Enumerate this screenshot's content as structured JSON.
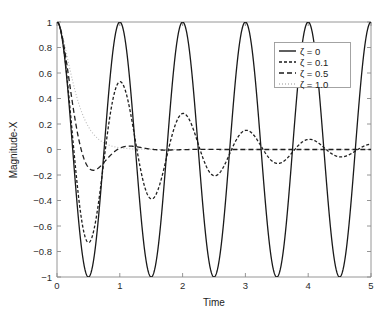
{
  "chart_data": {
    "type": "line",
    "title": "",
    "xlabel": "Time",
    "ylabel": "Magnitude-X",
    "xlim": [
      0,
      5
    ],
    "ylim": [
      -1,
      1
    ],
    "xticks": [
      "0",
      "1",
      "2",
      "3",
      "4",
      "5"
    ],
    "xtick_values": [
      0,
      1,
      2,
      3,
      4,
      5
    ],
    "yticks": [
      "1",
      "0.8",
      "0.6",
      "0.4",
      "0.2",
      "0",
      "−0.2",
      "−0.4",
      "−0.6",
      "−0.8",
      "−1"
    ],
    "ytick_values": [
      1,
      0.8,
      0.6,
      0.4,
      0.2,
      0,
      -0.2,
      -0.4,
      -0.6,
      -0.8,
      -1
    ],
    "grid": false,
    "legend_position": "upper right",
    "series": [
      {
        "name": "ζ = 0",
        "zeta": 0,
        "style": "solid",
        "color": "#1a1a1a",
        "description": "Undamped free vibration, cos(2πt), constant unit amplitude",
        "peaks_t": [
          0,
          1,
          2,
          3,
          4,
          5
        ],
        "peaks_y": [
          1,
          1,
          1,
          1,
          1,
          1
        ],
        "troughs_t": [
          0.5,
          1.5,
          2.5,
          3.5,
          4.5
        ],
        "troughs_y": [
          -1,
          -1,
          -1,
          -1,
          -1
        ]
      },
      {
        "name": "ζ = 0.1",
        "zeta": 0.1,
        "style": "dashed-fine",
        "color": "#1a1a1a",
        "description": "Lightly damped, slowly decaying oscillation",
        "peaks_t": [
          1.0,
          2.0,
          3.0,
          4.0
        ],
        "peaks_y": [
          0.54,
          0.29,
          0.16,
          0.07
        ],
        "troughs_t": [
          0.5,
          1.5,
          2.5,
          3.5,
          4.5
        ],
        "troughs_y": [
          -0.73,
          -0.39,
          -0.21,
          -0.11,
          -0.06
        ]
      },
      {
        "name": "ζ = 0.5",
        "zeta": 0.5,
        "style": "dashed-long",
        "color": "#1a1a1a",
        "description": "Heavily damped, single undershoot then settles to zero",
        "peaks_t": [
          1.2
        ],
        "peaks_y": [
          0.03
        ],
        "troughs_t": [
          0.55
        ],
        "troughs_y": [
          -0.16
        ]
      },
      {
        "name": "ζ = 1.0",
        "zeta": 1.0,
        "style": "dotted",
        "color": "#b4b4b4",
        "description": "Critically damped, monotonic decay to zero with no overshoot",
        "peaks_t": [],
        "peaks_y": [],
        "troughs_t": [],
        "troughs_y": []
      }
    ],
    "sample_points": {
      "t": [
        0,
        0.1,
        0.2,
        0.3,
        0.4,
        0.5,
        0.6,
        0.7,
        0.8,
        0.9,
        1.0,
        1.25,
        1.5,
        1.75,
        2.0,
        2.25,
        2.5,
        2.75,
        3.0,
        3.25,
        3.5,
        3.75,
        4.0,
        4.25,
        4.5,
        4.75,
        5.0
      ],
      "zeta_0": [
        1,
        0.81,
        0.31,
        -0.31,
        -0.81,
        -1,
        -0.81,
        -0.31,
        0.31,
        0.81,
        1,
        0,
        -1,
        0,
        1,
        0,
        -1,
        0,
        1,
        0,
        -1,
        0,
        1,
        0,
        -1,
        0,
        1
      ],
      "zeta_0_1": [
        1,
        0.76,
        0.27,
        -0.26,
        -0.73,
        -0.88,
        -0.69,
        -0.26,
        0.24,
        0.5,
        0.54,
        0.0,
        -0.39,
        0.0,
        0.29,
        0.0,
        -0.21,
        0.0,
        0.16,
        0.0,
        -0.11,
        0.0,
        0.07,
        0.0,
        -0.06,
        0.0,
        0.06
      ],
      "zeta_0_5": [
        1,
        0.62,
        0.27,
        0.02,
        -0.11,
        -0.16,
        -0.15,
        -0.12,
        -0.07,
        -0.03,
        0.0,
        0.03,
        0.03,
        0.02,
        0.02,
        0.01,
        0.01,
        0.01,
        0.01,
        0.0,
        0.0,
        0.0,
        0.0,
        0.0,
        0.0,
        0.0,
        0.0
      ],
      "zeta_1_0": [
        1,
        0.83,
        0.63,
        0.46,
        0.33,
        0.23,
        0.16,
        0.11,
        0.07,
        0.05,
        0.03,
        0.01,
        0.01,
        0.0,
        0.0,
        0.0,
        0.0,
        0.0,
        0.0,
        0.0,
        0.0,
        0.0,
        0.0,
        0.0,
        0.0,
        0.0,
        0.0
      ]
    }
  },
  "axes": {
    "ylabel": "Magnitude-X",
    "xlabel": "Time"
  },
  "legend": {
    "entries": [
      {
        "label": "ζ = 0"
      },
      {
        "label": "ζ = 0.1"
      },
      {
        "label": "ζ = 0.5"
      },
      {
        "label": "ζ = 1.0"
      }
    ]
  }
}
